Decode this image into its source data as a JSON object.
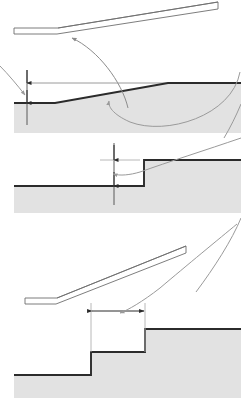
{
  "canvas": {
    "width": 241,
    "height": 404,
    "background": "#ffffff"
  },
  "colors": {
    "ground_fill": "#e2e2e2",
    "ground_line": "#2b2b2b",
    "reference_line": "#9a9a9a",
    "plank_outline": "#6e6e6e",
    "plank_fill": "#ffffff",
    "dimension_line": "#4a4a4a",
    "leader_line": "#8c8c8c",
    "extension_line": "#b0b0b0"
  },
  "diagram": {
    "panels": [
      {
        "id": "panel-ramp-upper",
        "name": "upper-ramp-plank",
        "description": "Portable ramp plank shown in side elevation, low end at left, high end at right"
      },
      {
        "id": "panel-slope-rise",
        "name": "sloped-ground-rise",
        "description": "Sloped ground profile with vertical rise dimension measured from reference line"
      },
      {
        "id": "panel-step-rise",
        "name": "single-step-rise",
        "description": "Single step profile with vertical step height dimension"
      },
      {
        "id": "panel-ramp-lower",
        "name": "lower-ramp-plank",
        "description": "Portable ramp plank spanning two steps"
      },
      {
        "id": "panel-step-run",
        "name": "two-step-run",
        "description": "Two step profile with horizontal tread run dimension"
      }
    ]
  },
  "geometry": {
    "upper_plank": {
      "tip_left_x": 14,
      "tip_right_x": 58,
      "tip_top_y": 28,
      "tip_bottom_y": 34,
      "high_end_x": 218,
      "high_end_top_y": 2,
      "high_end_bottom_y": 9,
      "thickness": 6
    },
    "slope_panel": {
      "reference_line_y": 83,
      "ground_left_y": 103,
      "ground_flat_end_x": 55,
      "slope_top_x": 168,
      "ground_right_y": 83,
      "fill_bottom_y": 133,
      "left_edge_x": 14,
      "right_edge_x": 241
    },
    "slope_dimension": {
      "x": 27,
      "top_y": 70,
      "arrow_upper_y": 83,
      "arrow_lower_y": 103,
      "bottom_y": 125,
      "label": ""
    },
    "step_panel": {
      "upper_level_y": 160,
      "lower_level_y": 186,
      "riser_x": 144,
      "left_edge_x": 14,
      "right_edge_x": 241,
      "fill_bottom_y": 213
    },
    "step_dimension": {
      "x": 114,
      "top_y": 143,
      "arrow_upper_y": 160,
      "arrow_lower_y": 186,
      "bottom_y": 205,
      "extension_left_x": 100,
      "extension_right_x": 140,
      "label": ""
    },
    "lower_plank": {
      "tip_left_x": 25,
      "tip_right_x": 57,
      "tip_top_y": 298,
      "tip_bottom_y": 304,
      "high_end_x": 186,
      "high_end_top_y": 246,
      "high_end_bottom_y": 253,
      "thickness": 6
    },
    "stairs_panel": {
      "lower_level_y": 375,
      "middle_level_y": 352,
      "upper_level_y": 329,
      "riser_one_x": 91,
      "riser_two_x": 145,
      "left_edge_x": 14,
      "right_edge_x": 241,
      "fill_bottom_y": 398
    },
    "run_dimension": {
      "y": 311,
      "left_x": 91,
      "right_x": 145,
      "extension_top_y": 303,
      "extension_bottom_y": 352,
      "label": ""
    },
    "leaders": [
      {
        "name": "leader-to-plank-tip",
        "from_x": 128,
        "from_y": 108,
        "to_x": 71,
        "to_y": 36,
        "arrow_at": "end"
      },
      {
        "name": "leader-to-slope",
        "from_x": 238,
        "from_y": 76,
        "to_x": 109,
        "to_y": 100,
        "arrow_at": "end"
      },
      {
        "name": "leader-to-step-riser",
        "from_x": 238,
        "from_y": 150,
        "to_x": 112,
        "to_y": 173,
        "arrow_at": "end"
      },
      {
        "name": "leader-to-run-dimension",
        "from_x": 236,
        "from_y": 229,
        "to_x": 119,
        "to_y": 313,
        "arrow_at": "end"
      },
      {
        "name": "leader-from-left-margin",
        "from_x": 0,
        "from_y": 68,
        "to_x": 26,
        "to_y": 96,
        "arrow_at": "end"
      }
    ]
  }
}
